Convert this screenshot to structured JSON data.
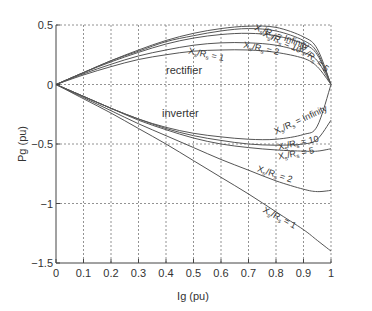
{
  "chart_data": {
    "type": "line",
    "title": "",
    "xlabel": "Ig (pu)",
    "ylabel": "Pg (pu)",
    "xlim": [
      0,
      1
    ],
    "ylim": [
      -1.5,
      0.5
    ],
    "grid": true,
    "xticks": [
      "0",
      "0.1",
      "0.2",
      "0.3",
      "0.4",
      "0.5",
      "0.6",
      "0.7",
      "0.8",
      "0.9",
      "1"
    ],
    "yticks": [
      "0.5",
      "0",
      "−0.5",
      "−1",
      "−1.5"
    ],
    "annotations": [
      "rectifier",
      "inverter"
    ],
    "x": [
      0,
      0.1,
      0.2,
      0.3,
      0.4,
      0.5,
      0.6,
      0.7,
      0.8,
      0.9,
      0.95,
      1.0
    ],
    "series": [
      {
        "name": "rectifier X_s/R_s = Infinity",
        "values": [
          0,
          0.1,
          0.2,
          0.29,
          0.37,
          0.43,
          0.47,
          0.49,
          0.48,
          0.4,
          0.3,
          0
        ]
      },
      {
        "name": "rectifier X_s/R_s = 10",
        "values": [
          0,
          0.1,
          0.2,
          0.28,
          0.36,
          0.41,
          0.45,
          0.47,
          0.45,
          0.37,
          0.27,
          0
        ]
      },
      {
        "name": "rectifier X_s/R_s = 5",
        "values": [
          0,
          0.1,
          0.19,
          0.27,
          0.34,
          0.39,
          0.42,
          0.43,
          0.41,
          0.34,
          0.25,
          0
        ]
      },
      {
        "name": "rectifier X_s/R_s = 2",
        "values": [
          0,
          0.09,
          0.17,
          0.24,
          0.29,
          0.33,
          0.35,
          0.35,
          0.33,
          0.27,
          0.2,
          0
        ]
      },
      {
        "name": "rectifier X_s/R_s = 1",
        "values": [
          0,
          0.08,
          0.15,
          0.21,
          0.25,
          0.28,
          0.29,
          0.29,
          0.27,
          0.22,
          0.15,
          0
        ]
      },
      {
        "name": "inverter X_s/R_s = Infinity",
        "values": [
          0,
          -0.1,
          -0.2,
          -0.29,
          -0.36,
          -0.41,
          -0.44,
          -0.46,
          -0.46,
          -0.42,
          -0.35,
          0
        ]
      },
      {
        "name": "inverter X_s/R_s = 10",
        "values": [
          0,
          -0.1,
          -0.2,
          -0.29,
          -0.37,
          -0.43,
          -0.47,
          -0.5,
          -0.51,
          -0.5,
          -0.46,
          -0.3
        ]
      },
      {
        "name": "inverter X_s/R_s = 5",
        "values": [
          0,
          -0.1,
          -0.2,
          -0.3,
          -0.38,
          -0.45,
          -0.5,
          -0.53,
          -0.55,
          -0.56,
          -0.56,
          -0.54
        ]
      },
      {
        "name": "inverter X_s/R_s = 2",
        "values": [
          0,
          -0.11,
          -0.22,
          -0.33,
          -0.43,
          -0.53,
          -0.63,
          -0.72,
          -0.81,
          -0.88,
          -0.9,
          -0.89
        ]
      },
      {
        "name": "inverter X_s/R_s = 1",
        "values": [
          0,
          -0.12,
          -0.24,
          -0.37,
          -0.5,
          -0.64,
          -0.78,
          -0.92,
          -1.07,
          -1.22,
          -1.31,
          -1.4
        ]
      }
    ],
    "curve_labels": [
      {
        "prefix": "X",
        "sub1": "s",
        "mid": "/R",
        "sub2": "s",
        "suffix": " = Infinity",
        "x": 0.72,
        "y": 0.46,
        "rot": 20
      },
      {
        "prefix": "X",
        "sub1": "s",
        "mid": "/R",
        "sub2": "s",
        "suffix": " = 10",
        "x": 0.75,
        "y": 0.41,
        "rot": 25
      },
      {
        "prefix": "X",
        "sub1": "s",
        "mid": "/R",
        "sub2": "s",
        "suffix": " = 5",
        "x": 0.88,
        "y": 0.3,
        "rot": 40
      },
      {
        "prefix": "X",
        "sub1": "s",
        "mid": "/R",
        "sub2": "s",
        "suffix": " = 2",
        "x": 0.68,
        "y": 0.31,
        "rot": 12
      },
      {
        "prefix": "X",
        "sub1": "s",
        "mid": "/R",
        "sub2": "s",
        "suffix": " = 1",
        "x": 0.48,
        "y": 0.26,
        "rot": 12
      },
      {
        "prefix": "X",
        "sub1": "s",
        "mid": "/R",
        "sub2": "s",
        "suffix": " = Infinity",
        "x": 0.8,
        "y": -0.42,
        "rot": -25
      },
      {
        "prefix": "X",
        "sub1": "s",
        "mid": "/R",
        "sub2": "s",
        "suffix": " = 10",
        "x": 0.81,
        "y": -0.55,
        "rot": -12
      },
      {
        "prefix": "X",
        "sub1": "s",
        "mid": "/R",
        "sub2": "s",
        "suffix": " = 5",
        "x": 0.81,
        "y": -0.63,
        "rot": -10
      },
      {
        "prefix": "X",
        "sub1": "s",
        "mid": "/R",
        "sub2": "s",
        "suffix": " = 2",
        "x": 0.73,
        "y": -0.73,
        "rot": 18
      },
      {
        "prefix": "X",
        "sub1": "s",
        "mid": "/R",
        "sub2": "s",
        "suffix": " = 1",
        "x": 0.75,
        "y": -1.07,
        "rot": 28
      }
    ]
  },
  "labels": {
    "xlabel": "Ig (pu)",
    "ylabel": "Pg (pu)",
    "rectifier": "rectifier",
    "inverter": "inverter"
  }
}
